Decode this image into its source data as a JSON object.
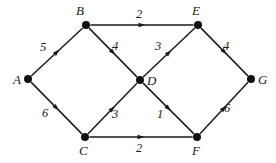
{
  "figure": {
    "type": "directed-weighted-graph",
    "title": "",
    "background_color": "#ffffff",
    "stroke_color": "#1a1a1a",
    "node_color": "#111111",
    "width": 276,
    "height": 163
  },
  "nodes": [
    {
      "id": "A",
      "label": "A",
      "x": 28,
      "y": 79,
      "label_x": 13,
      "label_y": 73
    },
    {
      "id": "B",
      "label": "B",
      "x": 86,
      "y": 25,
      "label_x": 76,
      "label_y": 4
    },
    {
      "id": "C",
      "label": "C",
      "x": 85,
      "y": 137,
      "label_x": 79,
      "label_y": 144
    },
    {
      "id": "D",
      "label": "D",
      "x": 140,
      "y": 80,
      "label_x": 147,
      "label_y": 74
    },
    {
      "id": "E",
      "label": "E",
      "x": 198,
      "y": 25,
      "label_x": 192,
      "label_y": 4
    },
    {
      "id": "F",
      "label": "F",
      "x": 197,
      "y": 137,
      "label_x": 192,
      "label_y": 144
    },
    {
      "id": "G",
      "label": "G",
      "x": 251,
      "y": 79,
      "label_x": 258,
      "label_y": 73
    }
  ],
  "edges": [
    {
      "id": "A-B",
      "from": "A",
      "to": "B",
      "weight": "5",
      "label_x": 40,
      "label_y": 41
    },
    {
      "id": "A-C",
      "from": "A",
      "to": "C",
      "weight": "6",
      "label_x": 42,
      "label_y": 107
    },
    {
      "id": "B-E",
      "from": "B",
      "to": "E",
      "weight": "2",
      "label_x": 136,
      "label_y": 8
    },
    {
      "id": "B-D",
      "from": "B",
      "to": "D",
      "weight": "4",
      "label_x": 112,
      "label_y": 40
    },
    {
      "id": "C-D",
      "from": "C",
      "to": "D",
      "weight": "3",
      "label_x": 112,
      "label_y": 108
    },
    {
      "id": "C-F",
      "from": "C",
      "to": "F",
      "weight": "2",
      "label_x": 136,
      "label_y": 142
    },
    {
      "id": "D-E",
      "from": "D",
      "to": "E",
      "weight": "3",
      "label_x": 155,
      "label_y": 40
    },
    {
      "id": "D-F",
      "from": "D",
      "to": "F",
      "weight": "1",
      "label_x": 157,
      "label_y": 108
    },
    {
      "id": "E-G",
      "from": "E",
      "to": "G",
      "weight": "4",
      "label_x": 223,
      "label_y": 40
    },
    {
      "id": "F-G",
      "from": "F",
      "to": "G",
      "weight": "6",
      "label_x": 224,
      "label_y": 102
    }
  ],
  "chart_data": {
    "type": "diagram",
    "nodes": [
      "A",
      "B",
      "C",
      "D",
      "E",
      "F",
      "G"
    ],
    "weighted_directed_edges": [
      {
        "from": "A",
        "to": "B",
        "weight": 5
      },
      {
        "from": "A",
        "to": "C",
        "weight": 6
      },
      {
        "from": "B",
        "to": "E",
        "weight": 2
      },
      {
        "from": "B",
        "to": "D",
        "weight": 4
      },
      {
        "from": "C",
        "to": "D",
        "weight": 3
      },
      {
        "from": "C",
        "to": "F",
        "weight": 2
      },
      {
        "from": "D",
        "to": "E",
        "weight": 3
      },
      {
        "from": "D",
        "to": "F",
        "weight": 1
      },
      {
        "from": "E",
        "to": "G",
        "weight": 4
      },
      {
        "from": "F",
        "to": "G",
        "weight": 6
      }
    ]
  }
}
